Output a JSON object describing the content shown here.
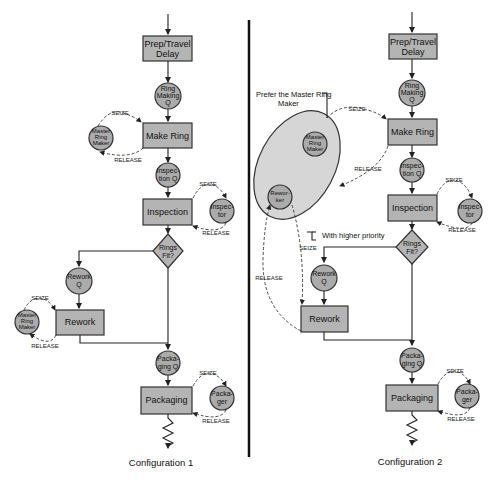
{
  "configs": [
    {
      "caption": "Configuration 1",
      "prep": [
        "Prep/Travel",
        "Delay"
      ],
      "ring_q": [
        "Ring",
        "Making",
        "Q"
      ],
      "make_ring": "Make Ring",
      "master": [
        "Master",
        "Ring",
        "Maker"
      ],
      "insp_q": [
        "Inspec-",
        "tion Q"
      ],
      "inspection": "Inspection",
      "inspector": [
        "Inspec-",
        "tor"
      ],
      "decision": [
        "Rings",
        "Fit?"
      ],
      "rework_q": [
        "Rework",
        "Q"
      ],
      "rework": "Rework",
      "master2": [
        "Master",
        "Ring",
        "Maker"
      ],
      "pack_q": [
        "Packa-",
        "ging Q"
      ],
      "packaging": "Packaging",
      "packager": [
        "Packa-",
        "ger"
      ]
    },
    {
      "caption": "Configuration 2",
      "prep": [
        "Prep/Travel",
        "Delay"
      ],
      "ring_q": [
        "Ring",
        "Making",
        "Q"
      ],
      "make_ring": "Make Ring",
      "master": [
        "Master",
        "Ring",
        "Maker"
      ],
      "reworker": [
        "Rewor-",
        "ker"
      ],
      "insp_q": [
        "Inspec-",
        "tion Q"
      ],
      "inspection": "Inspection",
      "inspector": [
        "Inspec-",
        "tor"
      ],
      "decision": [
        "Rings",
        "Fit?"
      ],
      "rework_q": [
        "Rework",
        "Q"
      ],
      "rework": "Rework",
      "pack_q": [
        "Packa-",
        "ging Q"
      ],
      "packaging": "Packaging",
      "packager": [
        "Packa-",
        "ger"
      ],
      "note_prefer": [
        "Prefer the Master Ring",
        "Maker"
      ],
      "note_priority": "With higher priority"
    }
  ],
  "labels": {
    "seize": "SEIZE",
    "release": "RELEASE"
  }
}
